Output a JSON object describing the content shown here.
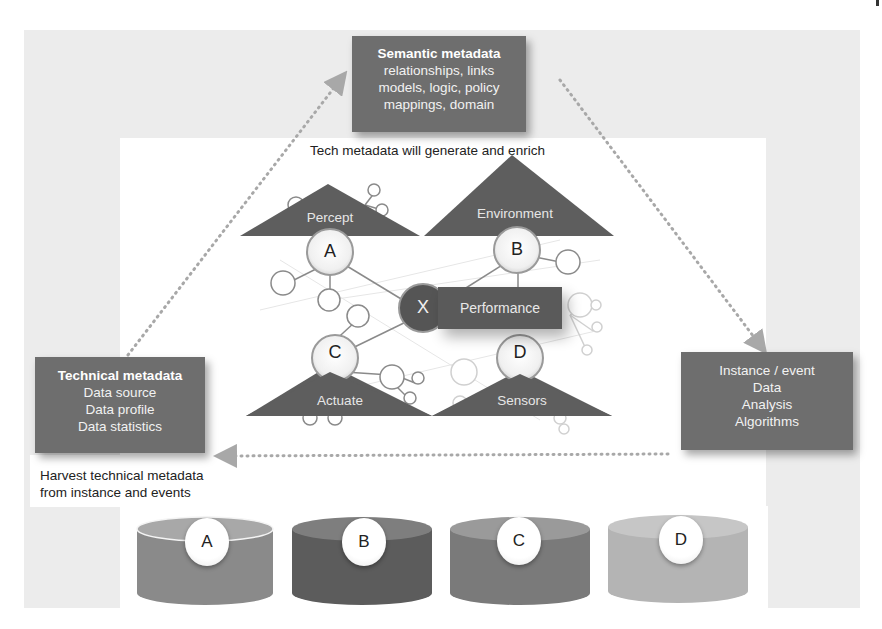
{
  "semantic_box": {
    "title": "Semantic metadata",
    "lines": [
      "relationships, links",
      "models, logic, policy",
      "mappings, domain"
    ]
  },
  "technical_box": {
    "title": "Technical metadata",
    "lines": [
      "Data source",
      "Data profile",
      "Data statistics"
    ]
  },
  "instance_box": {
    "lines": [
      "Instance / event",
      "Data",
      "Analysis",
      "Algorithms"
    ]
  },
  "captions": {
    "top": "Tech metadata will generate and enrich",
    "bottom_line1": "Harvest technical metadata",
    "bottom_line2": "from instance and events"
  },
  "triangles": {
    "percept": "Percept",
    "environment": "Environment",
    "actuate": "Actuate",
    "sensors": "Sensors"
  },
  "nodes": {
    "a": "A",
    "b": "B",
    "c": "C",
    "d": "D",
    "x": "X"
  },
  "performance": "Performance",
  "cylinders": [
    {
      "label": "A",
      "color": "#8a8a8a"
    },
    {
      "label": "B",
      "color": "#5c5c5c"
    },
    {
      "label": "C",
      "color": "#7a7a7a"
    },
    {
      "label": "D",
      "color": "#b4b4b4"
    }
  ],
  "colors": {
    "box_fill": "#6e6e6e",
    "background_gray": "#ececec",
    "triangle_fill": "#5e5e5e",
    "dotted_arrow": "#a8a8a8"
  }
}
